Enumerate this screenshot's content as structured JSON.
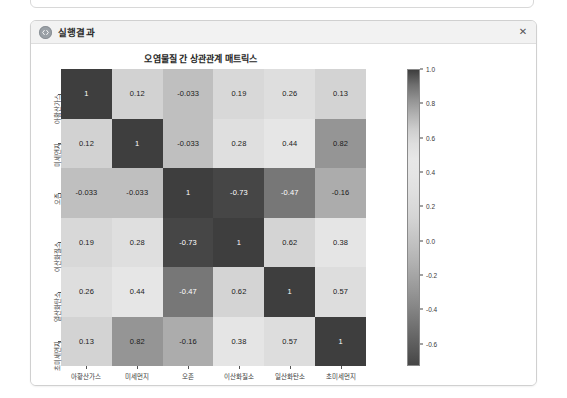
{
  "window": {
    "title": "실행결과",
    "icon": "code-circle-icon",
    "close_label": "✕"
  },
  "chart_data": {
    "type": "heatmap",
    "title": "오염물질 간 상관관계 매트릭스",
    "xlabel": "",
    "ylabel": "",
    "categories": [
      "아황산가스",
      "미세먼지",
      "오존",
      "이산화질소",
      "일산화탄소",
      "초미세먼지"
    ],
    "x_tick_labels": [
      "아황산가스",
      "미세먼지",
      "오존",
      "이산화질소",
      "일산화탄소",
      "초미세먼지"
    ],
    "y_tick_labels": [
      "아황산가스",
      "미세먼지",
      "오존",
      "이산화질소",
      "일산화탄소",
      "초미세먼지"
    ],
    "colormap": "gray",
    "colorbar": {
      "position": "right",
      "ticks": [
        "1.0",
        "0.8",
        "0.6",
        "0.4",
        "0.2",
        "0.0",
        "-0.2",
        "-0.4",
        "-0.6"
      ],
      "tick_values": [
        1.0,
        0.8,
        0.6,
        0.4,
        0.2,
        0.0,
        -0.2,
        -0.4,
        -0.6
      ],
      "vmin": -0.73,
      "vmax": 1.0,
      "top_color": "#3a3a3a",
      "bottom_color": "#4a4a4a",
      "mid_color": "#e8e8e8"
    },
    "grid": false,
    "annotations": true,
    "rows": [
      {
        "label": "아황산가스",
        "values": [
          1,
          0.12,
          -0.033,
          0.19,
          0.26,
          0.13
        ],
        "labels": [
          "1",
          "0.12",
          "-0.033",
          "0.19",
          "0.26",
          "0.13"
        ]
      },
      {
        "label": "미세먼지",
        "values": [
          0.12,
          1,
          -0.033,
          0.28,
          0.44,
          0.82
        ],
        "labels": [
          "0.12",
          "1",
          "-0.033",
          "0.28",
          "0.44",
          "0.82"
        ]
      },
      {
        "label": "오존",
        "values": [
          -0.033,
          -0.033,
          1,
          -0.73,
          -0.47,
          -0.16
        ],
        "labels": [
          "-0.033",
          "-0.033",
          "1",
          "-0.73",
          "-0.47",
          "-0.16"
        ]
      },
      {
        "label": "이산화질소",
        "values": [
          0.19,
          0.28,
          -0.73,
          1,
          0.62,
          0.38
        ],
        "labels": [
          "0.19",
          "0.28",
          "-0.73",
          "1",
          "0.62",
          "0.38"
        ]
      },
      {
        "label": "일산화탄소",
        "values": [
          0.26,
          0.44,
          -0.47,
          0.62,
          1,
          0.57
        ],
        "labels": [
          "0.26",
          "0.44",
          "-0.47",
          "0.62",
          "1",
          "0.57"
        ]
      },
      {
        "label": "초미세먼지",
        "values": [
          0.13,
          0.82,
          -0.16,
          0.38,
          0.57,
          1
        ],
        "labels": [
          "0.13",
          "0.82",
          "-0.16",
          "0.38",
          "0.57",
          "1"
        ]
      }
    ]
  }
}
